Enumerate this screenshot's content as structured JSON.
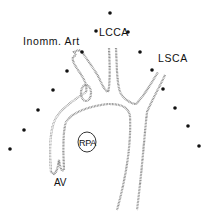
{
  "diagram": {
    "type": "anatomical-illustration",
    "labels": {
      "inomm_art": "Inomm. Art",
      "lcca": "LCCA",
      "lsca": "LSCA",
      "rpa": "RPA",
      "av": "AV"
    },
    "markers": [
      {
        "x": 110,
        "y": 13
      },
      {
        "x": 96,
        "y": 31
      },
      {
        "x": 128,
        "y": 32
      },
      {
        "x": 82,
        "y": 52
      },
      {
        "x": 140,
        "y": 52
      },
      {
        "x": 67,
        "y": 71
      },
      {
        "x": 152,
        "y": 70
      },
      {
        "x": 53,
        "y": 90
      },
      {
        "x": 163,
        "y": 89
      },
      {
        "x": 38,
        "y": 110
      },
      {
        "x": 175,
        "y": 108
      },
      {
        "x": 24,
        "y": 130
      },
      {
        "x": 188,
        "y": 126
      },
      {
        "x": 10,
        "y": 149
      },
      {
        "x": 199,
        "y": 146
      }
    ],
    "colors": {
      "outline": "#888888",
      "marker": "#111111",
      "background": "#ffffff"
    }
  }
}
